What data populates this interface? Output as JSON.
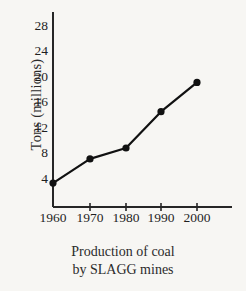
{
  "chart_data": {
    "type": "line",
    "title": "",
    "caption_line1": "Production of coal",
    "caption_line2": "by SLAGG mines",
    "xlabel": "",
    "ylabel": "Tons (millions)",
    "categories": [
      "1960",
      "1970",
      "1980",
      "1990",
      "2000"
    ],
    "x": [
      1960,
      1970,
      1980,
      1990,
      2000
    ],
    "values": [
      3.2,
      7.0,
      8.7,
      14.4,
      19.0
    ],
    "series": [
      {
        "name": "Production of coal by SLAGG mines",
        "values": [
          3.2,
          7.0,
          8.7,
          14.4,
          19.0
        ]
      }
    ],
    "ylim": [
      0,
      30
    ],
    "yticks": [
      4,
      8,
      12,
      16,
      20,
      24,
      28
    ],
    "ytick_labels": [
      "4",
      "8",
      "12",
      "16",
      "20",
      "24",
      "28"
    ],
    "xtick_labels": [
      "1960",
      "1970",
      "1980",
      "1990",
      "2000"
    ],
    "grid": false,
    "legend": "none",
    "marker": "filled-circle",
    "line_color": "#111111",
    "marker_color": "#111111",
    "axis_color": "#262626",
    "background_color": "#f7f6f3"
  }
}
